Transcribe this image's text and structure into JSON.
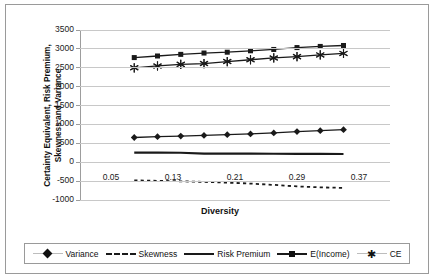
{
  "chart_data": {
    "type": "line",
    "title": "",
    "xlabel": "Diversity",
    "ylabel": "Certainty Equivalent, Risk Premium, Skewness and Variance",
    "xlim": [
      0.01,
      0.41
    ],
    "ylim": [
      -1000,
      3500
    ],
    "ytick_labels": [
      "3500",
      "3000",
      "2500",
      "2000",
      "1500",
      "1000",
      "500",
      "0",
      "-500",
      "-1000"
    ],
    "ytick_values": [
      3500,
      3000,
      2500,
      2000,
      1500,
      1000,
      500,
      0,
      -500,
      -1000
    ],
    "xtick_labels": [
      "0.05",
      "0.13",
      "0.21",
      "0.29",
      "0.37"
    ],
    "xtick_values": [
      0.05,
      0.13,
      0.21,
      0.29,
      0.37
    ],
    "grid": "horizontal",
    "legend_position": "bottom",
    "x": [
      0.08,
      0.11,
      0.14,
      0.17,
      0.2,
      0.23,
      0.26,
      0.29,
      0.32,
      0.35
    ],
    "series": [
      {
        "name": "Variance",
        "marker": "diamond",
        "line": "solid",
        "values": [
          655,
          675,
          692,
          710,
          728,
          748,
          775,
          810,
          835,
          862
        ]
      },
      {
        "name": "Skewness",
        "marker": "none",
        "line": "dashed",
        "values": [
          -480,
          -492,
          -505,
          -520,
          -540,
          -565,
          -600,
          -640,
          -665,
          -680
        ]
      },
      {
        "name": "Risk Premium",
        "marker": "none",
        "line": "thick-solid",
        "values": [
          255,
          253,
          251,
          230,
          228,
          226,
          224,
          222,
          220,
          218
        ]
      },
      {
        "name": "E(Income)",
        "marker": "square",
        "line": "solid",
        "values": [
          2770,
          2812,
          2855,
          2890,
          2912,
          2950,
          2985,
          3035,
          3065,
          3090
        ]
      },
      {
        "name": "CE",
        "marker": "star",
        "line": "solid",
        "values": [
          2500,
          2548,
          2590,
          2612,
          2665,
          2712,
          2760,
          2795,
          2840,
          2880
        ]
      }
    ]
  },
  "axis": {
    "y_title": "Certainty Equivalent, Risk Premium, Skewness and Variance",
    "x_title": "Diversity"
  },
  "legend": {
    "items": [
      {
        "label": "Variance",
        "marker": "diamond-marker-icon"
      },
      {
        "label": "Skewness",
        "marker": "dashed-line-icon"
      },
      {
        "label": "Risk Premium",
        "marker": "thick-line-icon"
      },
      {
        "label": "E(Income)",
        "marker": "square-marker-icon"
      },
      {
        "label": "CE",
        "marker": "star-marker-icon"
      }
    ]
  },
  "colors": {
    "series_stroke": "#1a1a1a",
    "gridline": "#c8c8c8",
    "axis": "#9d9d9d",
    "border": "#9a9a9a",
    "background": "#ffffff"
  }
}
